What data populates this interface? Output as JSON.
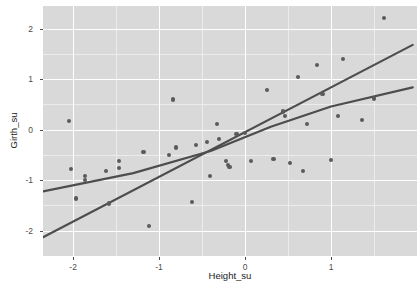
{
  "chart_data": {
    "type": "scatter",
    "title": "",
    "xlabel": "Height_su",
    "ylabel": "Girth_su",
    "xlim": [
      -2.35,
      2.0
    ],
    "ylim": [
      -2.5,
      2.45
    ],
    "xticks": [
      -2,
      -1,
      0,
      1
    ],
    "xticklabels": [
      "-2",
      "-1",
      "0",
      "1"
    ],
    "yticks": [
      -2,
      -1,
      0,
      1,
      2
    ],
    "yticklabels": [
      "-2",
      "-1",
      "0",
      "1",
      "2"
    ],
    "grid": true,
    "legend": "none",
    "panel_background": "#d9d9d9",
    "gridline_color": "#ffffff",
    "point_color": "#5a5a5a",
    "line_color": "#4d4d4d",
    "points": [
      {
        "x": -2.05,
        "y": 0.17
      },
      {
        "x": -2.02,
        "y": -0.78
      },
      {
        "x": -1.97,
        "y": -1.36
      },
      {
        "x": -1.86,
        "y": -0.92
      },
      {
        "x": -1.86,
        "y": -0.99
      },
      {
        "x": -1.62,
        "y": -0.82
      },
      {
        "x": -1.58,
        "y": -1.46
      },
      {
        "x": -1.47,
        "y": -0.62
      },
      {
        "x": -1.47,
        "y": -0.76
      },
      {
        "x": -1.18,
        "y": -0.44
      },
      {
        "x": -1.12,
        "y": -1.9
      },
      {
        "x": -0.88,
        "y": -0.5
      },
      {
        "x": -0.84,
        "y": 0.6
      },
      {
        "x": -0.8,
        "y": -0.35
      },
      {
        "x": -0.62,
        "y": -1.43
      },
      {
        "x": -0.57,
        "y": -0.3
      },
      {
        "x": -0.44,
        "y": -0.25
      },
      {
        "x": -0.41,
        "y": -0.92
      },
      {
        "x": -0.33,
        "y": 0.12
      },
      {
        "x": -0.3,
        "y": -0.18
      },
      {
        "x": -0.22,
        "y": -0.62
      },
      {
        "x": -0.2,
        "y": -0.7
      },
      {
        "x": -0.18,
        "y": -0.74
      },
      {
        "x": -0.1,
        "y": -0.08
      },
      {
        "x": 0.0,
        "y": -0.06
      },
      {
        "x": 0.07,
        "y": -0.62
      },
      {
        "x": 0.26,
        "y": 0.78
      },
      {
        "x": 0.33,
        "y": -0.58
      },
      {
        "x": 0.44,
        "y": 0.36
      },
      {
        "x": 0.46,
        "y": 0.28
      },
      {
        "x": 0.52,
        "y": -0.66
      },
      {
        "x": 0.62,
        "y": 1.05
      },
      {
        "x": 0.67,
        "y": -0.82
      },
      {
        "x": 0.72,
        "y": 0.12
      },
      {
        "x": 0.84,
        "y": 1.28
      },
      {
        "x": 0.9,
        "y": 0.7
      },
      {
        "x": 1.0,
        "y": -0.6
      },
      {
        "x": 1.08,
        "y": 0.28
      },
      {
        "x": 1.14,
        "y": 1.4
      },
      {
        "x": 1.36,
        "y": 0.2
      },
      {
        "x": 1.5,
        "y": 0.62
      },
      {
        "x": 1.62,
        "y": 2.22
      }
    ],
    "fits": [
      {
        "name": "linear-fit",
        "kind": "line",
        "description": "steeper straight regression line",
        "points": [
          {
            "x": -2.35,
            "y": -2.13
          },
          {
            "x": 1.95,
            "y": 1.68
          }
        ]
      },
      {
        "name": "shallow-fit",
        "kind": "line",
        "description": "shallower fitted trend line",
        "points": [
          {
            "x": -2.35,
            "y": -1.22
          },
          {
            "x": -1.3,
            "y": -0.86
          },
          {
            "x": -0.4,
            "y": -0.42
          },
          {
            "x": 0.3,
            "y": 0.06
          },
          {
            "x": 1.0,
            "y": 0.46
          },
          {
            "x": 1.95,
            "y": 0.84
          }
        ]
      }
    ]
  }
}
